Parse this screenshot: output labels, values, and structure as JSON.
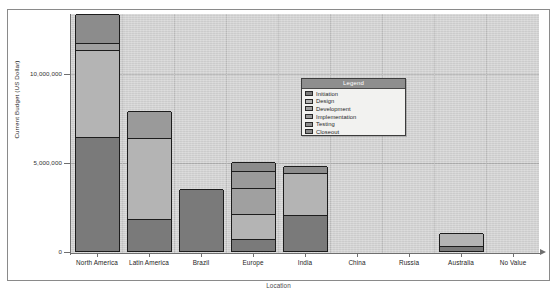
{
  "chart_data": {
    "type": "bar",
    "subtype": "stacked-bar",
    "title": "",
    "xlabel": "Location",
    "ylabel": "Current Budget (US Dollar)",
    "ylim": [
      0,
      13500000
    ],
    "ytick_labels": [
      "0",
      "5,000,000",
      "10,000,000"
    ],
    "ytick_values": [
      0,
      5000000,
      10000000
    ],
    "grid": true,
    "legend_position": "inside-right",
    "legend_title": "Legend",
    "categories": [
      "North America",
      "Latin America",
      "Brazil",
      "Europe",
      "India",
      "China",
      "Russia",
      "Australia",
      "No Value"
    ],
    "series": [
      {
        "name": "Initiation",
        "color": "#7a7a7a",
        "values": [
          6400000,
          1800000,
          3500000,
          650000,
          2000000,
          0,
          0,
          300000,
          0
        ]
      },
      {
        "name": "Design",
        "color": "#b4b4b4",
        "values": [
          4900000,
          4550000,
          0,
          1450000,
          2400000,
          0,
          0,
          700000,
          0
        ]
      },
      {
        "name": "Development",
        "color": "#a0a0a0",
        "values": [
          400000,
          0,
          0,
          1450000,
          0,
          0,
          0,
          0,
          0
        ]
      },
      {
        "name": "Implementation",
        "color": "#9a9a9a",
        "values": [
          0,
          1500000,
          0,
          950000,
          0,
          0,
          0,
          0,
          0
        ]
      },
      {
        "name": "Testing",
        "color": "#8c8c8c",
        "values": [
          1600000,
          0,
          0,
          500000,
          400000,
          0,
          0,
          0,
          0
        ]
      },
      {
        "name": "Closeout",
        "color": "#8a8a8a",
        "values": [
          0,
          0,
          0,
          0,
          0,
          0,
          0,
          0,
          0
        ]
      }
    ],
    "totals": [
      13300000,
      7850000,
      3500000,
      5000000,
      4800000,
      0,
      0,
      1000000,
      0
    ]
  },
  "axes": {
    "y_title": "Current Budget (US Dollar)",
    "x_title": "Location",
    "y_ticks": [
      {
        "label": "10,000,000",
        "value": 10000000
      },
      {
        "label": "5,000,000",
        "value": 5000000
      },
      {
        "label": "0",
        "value": 0
      }
    ]
  },
  "legend": {
    "title": "Legend",
    "items": [
      {
        "label": "Initiation",
        "color": "#7a7a7a"
      },
      {
        "label": "Design",
        "color": "#b4b4b4"
      },
      {
        "label": "Development",
        "color": "#a0a0a0"
      },
      {
        "label": "Implementation",
        "color": "#9a9a9a"
      },
      {
        "label": "Testing",
        "color": "#8c8c8c"
      },
      {
        "label": "Closeout",
        "color": "#8a8a8a"
      }
    ]
  },
  "colors": {
    "plot_background": "#d4d4d4",
    "page_background": "#ffffff",
    "axis": "#6f6f6f",
    "gridline": "#a8a8a8",
    "bar_outline": "#1d1d1d",
    "legend_header": "#8e8e8e",
    "legend_background": "#f2f2f0"
  }
}
